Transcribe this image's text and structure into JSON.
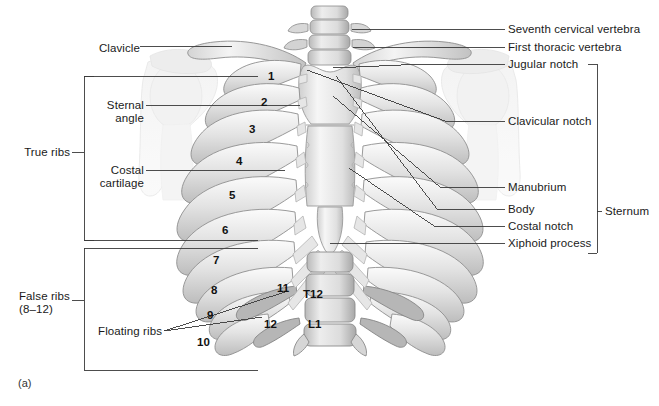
{
  "figure": {
    "panel_label": "(a)",
    "background": "#ffffff",
    "line_color": "#3a3a3a",
    "bone_light": "#efefef",
    "bone_mid": "#c9c9c9",
    "bone_shadow": "#9d9d9d",
    "ghost": "#ededed"
  },
  "labels_left": [
    {
      "id": "clavicle",
      "text": "Clavicle",
      "x": 95,
      "y": 48
    },
    {
      "id": "sternal-angle",
      "text": "Sternal\nangle",
      "x": 98,
      "y": 107
    },
    {
      "id": "true-ribs",
      "text": "True ribs",
      "x": 25,
      "y": 152
    },
    {
      "id": "costal-cartilage",
      "text": "Costal\ncartilage",
      "x": 98,
      "y": 172
    },
    {
      "id": "false-ribs",
      "text": "False ribs\n(8–12)",
      "x": 21,
      "y": 296
    },
    {
      "id": "floating-ribs",
      "text": "Floating ribs",
      "x": 96,
      "y": 331
    }
  ],
  "labels_right": [
    {
      "id": "seventh-cervical-vertebra",
      "text": "Seventh cervical vertebra",
      "x": 508,
      "y": 29
    },
    {
      "id": "first-thoracic-vertebra",
      "text": "First thoracic vertebra",
      "x": 508,
      "y": 47
    },
    {
      "id": "jugular-notch",
      "text": "Jugular notch",
      "x": 508,
      "y": 64
    },
    {
      "id": "clavicular-notch",
      "text": "Clavicular notch",
      "x": 508,
      "y": 121
    },
    {
      "id": "manubrium",
      "text": "Manubrium",
      "x": 508,
      "y": 187
    },
    {
      "id": "body",
      "text": "Body",
      "x": 508,
      "y": 209
    },
    {
      "id": "costal-notch",
      "text": "Costal notch",
      "x": 508,
      "y": 226
    },
    {
      "id": "xiphoid-process",
      "text": "Xiphoid process",
      "x": 508,
      "y": 243
    },
    {
      "id": "sternum",
      "text": "Sternum",
      "x": 605,
      "y": 211
    }
  ],
  "rib_numbers": [
    {
      "n": "1",
      "x": 268,
      "y": 70
    },
    {
      "n": "2",
      "x": 261,
      "y": 96
    },
    {
      "n": "3",
      "x": 249,
      "y": 123
    },
    {
      "n": "4",
      "x": 236,
      "y": 155
    },
    {
      "n": "5",
      "x": 229,
      "y": 189
    },
    {
      "n": "6",
      "x": 222,
      "y": 224
    },
    {
      "n": "7",
      "x": 213,
      "y": 254
    },
    {
      "n": "8",
      "x": 211,
      "y": 284
    },
    {
      "n": "9",
      "x": 207,
      "y": 309
    },
    {
      "n": "10",
      "x": 200,
      "y": 336
    },
    {
      "n": "11",
      "x": 277,
      "y": 282
    },
    {
      "n": "12",
      "x": 266,
      "y": 318
    }
  ],
  "vertebra_labels": [
    {
      "id": "t12",
      "text": "T12",
      "x": 303,
      "y": 288
    },
    {
      "id": "l1",
      "text": "L1",
      "x": 308,
      "y": 318
    }
  ]
}
